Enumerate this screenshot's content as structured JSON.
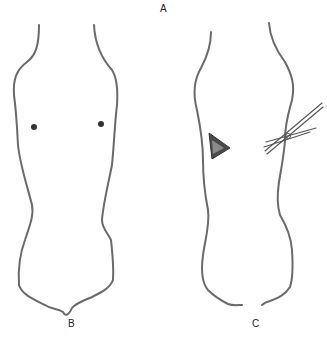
{
  "figure": {
    "panel_label_top": "A",
    "panel_label_left": "B",
    "panel_label_right": "C",
    "left_figure": {
      "description": "Outline of limb/body segment with two marked points",
      "markers": 2
    },
    "right_figure": {
      "description": "Outline with triangular defect and crossed instrument (scissors/forceps)",
      "defect_shape": "triangle",
      "instrument": "scissors"
    },
    "colors": {
      "line": "#6a6a6a",
      "marker": "#333333",
      "background": "#ffffff"
    }
  }
}
